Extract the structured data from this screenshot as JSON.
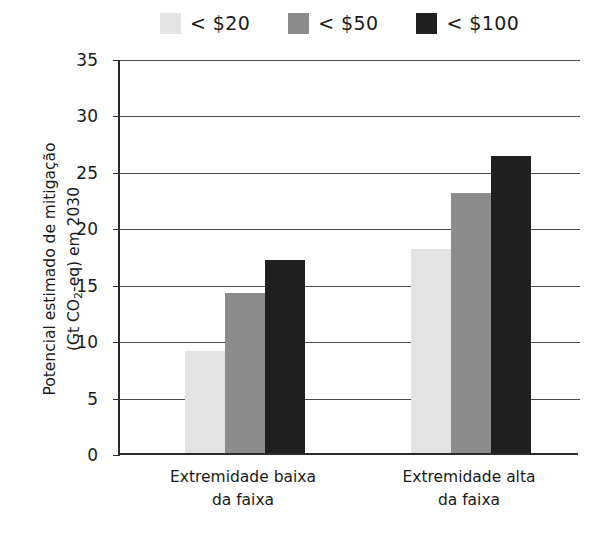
{
  "chart_data": {
    "type": "bar",
    "title": "",
    "xlabel": "",
    "ylabel": "Potencial estimado de mitigação (Gt CO2-eq) em 2030",
    "ylabel_line1": "Potencial estimado de mitigação",
    "ylabel_line2_pre": "(Gt CO",
    "ylabel_line2_sub": "2",
    "ylabel_line2_post": "-eq) em 2030",
    "categories": [
      "Extremidade baixa da faixa",
      "Extremidade alta da faixa"
    ],
    "category_lines": [
      [
        "Extremidade baixa",
        "da faixa"
      ],
      [
        "Extremidade alta",
        "da faixa"
      ]
    ],
    "series": [
      {
        "name": "< $20",
        "color": "#e3e3e3",
        "values": [
          9.0,
          18.1
        ]
      },
      {
        "name": "< $50",
        "color": "#8c8c8c",
        "values": [
          14.2,
          23.0
        ]
      },
      {
        "name": "< $100",
        "color": "#1f1f1f",
        "values": [
          17.1,
          26.3
        ]
      }
    ],
    "ylim": [
      0,
      35
    ],
    "yticks": [
      0,
      5,
      10,
      15,
      20,
      25,
      30,
      35
    ],
    "ytick_labels": [
      "0",
      "5",
      "10",
      "15",
      "20",
      "25",
      "30",
      "35"
    ],
    "grid": true,
    "grid_axis": "y",
    "legend_position": "top"
  },
  "legend": {
    "items": [
      {
        "label": "< $20",
        "color": "#e3e3e3"
      },
      {
        "label": "< $50",
        "color": "#8c8c8c"
      },
      {
        "label": "< $100",
        "color": "#1f1f1f"
      }
    ]
  }
}
